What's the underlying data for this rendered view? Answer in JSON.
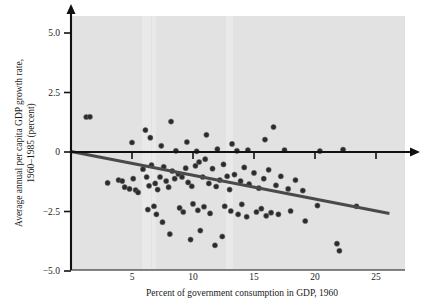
{
  "chart_data": {
    "type": "scatter",
    "title": "",
    "xlabel": "Percent of government consumption in GDP, 1960",
    "ylabel_line1": "Average annual per capita GDP growth rate,",
    "ylabel_line2": "1960–1985 (percent)",
    "xlim": [
      0,
      27.2
    ],
    "ylim": [
      -5.0,
      5.9
    ],
    "xticks": [
      5,
      10,
      15,
      20,
      25
    ],
    "xtick_labels": [
      "5",
      "10",
      "15",
      "20",
      "25"
    ],
    "yticks": [
      5.0,
      2.5,
      0,
      -2.5,
      -5.0
    ],
    "ytick_labels": [
      "5.0",
      "2.5",
      "0",
      "−2.5",
      "−5.0"
    ],
    "grid": false,
    "legend": null,
    "background_color": "#e2e2e2",
    "point_color": "#2b2b2b",
    "fit_line_color": "#4a4a4a",
    "axis_color": "#111111",
    "zero_line_value": 0,
    "fit_line": {
      "x_start": 0.0,
      "y_start": 0.02,
      "x_end": 26.1,
      "y_end": -2.58,
      "slope": -0.0996,
      "intercept": 0.02
    },
    "points": [
      [
        1.25,
        1.47
      ],
      [
        1.55,
        1.48
      ],
      [
        5.0,
        0.4
      ],
      [
        6.1,
        0.92
      ],
      [
        6.5,
        0.6
      ],
      [
        7.4,
        0.26
      ],
      [
        8.2,
        1.28
      ],
      [
        8.6,
        0.05
      ],
      [
        9.5,
        0.42
      ],
      [
        10.3,
        0.03
      ],
      [
        11.1,
        0.72
      ],
      [
        12.0,
        0.12
      ],
      [
        13.2,
        0.34
      ],
      [
        13.6,
        0.05
      ],
      [
        14.5,
        0.08
      ],
      [
        15.9,
        0.52
      ],
      [
        16.6,
        1.05
      ],
      [
        17.5,
        0.08
      ],
      [
        20.4,
        0.04
      ],
      [
        22.3,
        0.1
      ],
      [
        3.0,
        -1.3
      ],
      [
        3.9,
        -1.18
      ],
      [
        4.2,
        -1.22
      ],
      [
        4.4,
        -1.48
      ],
      [
        4.8,
        -1.55
      ],
      [
        5.1,
        -1.12
      ],
      [
        5.3,
        -1.6
      ],
      [
        5.5,
        -1.7
      ],
      [
        5.9,
        -0.72
      ],
      [
        6.2,
        -1.05
      ],
      [
        6.4,
        -1.42
      ],
      [
        6.6,
        -0.55
      ],
      [
        6.9,
        -1.32
      ],
      [
        7.1,
        -1.58
      ],
      [
        7.3,
        -1.05
      ],
      [
        7.6,
        -0.62
      ],
      [
        7.8,
        -1.22
      ],
      [
        8.0,
        -1.48
      ],
      [
        8.3,
        -0.8
      ],
      [
        8.5,
        -1.12
      ],
      [
        8.8,
        -0.92
      ],
      [
        9.1,
        -1.05
      ],
      [
        9.4,
        -0.68
      ],
      [
        9.6,
        -1.28
      ],
      [
        9.9,
        -1.44
      ],
      [
        10.2,
        -0.58
      ],
      [
        10.5,
        -0.42
      ],
      [
        10.8,
        -1.05
      ],
      [
        11.0,
        -0.3
      ],
      [
        11.3,
        -1.32
      ],
      [
        11.6,
        -0.7
      ],
      [
        11.9,
        -1.45
      ],
      [
        12.2,
        -1.18
      ],
      [
        12.5,
        -0.52
      ],
      [
        12.8,
        -1.02
      ],
      [
        13.0,
        -1.58
      ],
      [
        13.4,
        -0.95
      ],
      [
        13.9,
        -1.22
      ],
      [
        14.2,
        -0.65
      ],
      [
        14.6,
        -1.35
      ],
      [
        15.0,
        -0.88
      ],
      [
        15.4,
        -1.52
      ],
      [
        15.8,
        -1.12
      ],
      [
        16.2,
        -0.75
      ],
      [
        16.8,
        -1.4
      ],
      [
        17.2,
        -1.02
      ],
      [
        17.8,
        -1.55
      ],
      [
        18.4,
        -1.18
      ],
      [
        19.0,
        -1.62
      ],
      [
        6.3,
        -2.42
      ],
      [
        6.8,
        -2.28
      ],
      [
        7.0,
        -2.62
      ],
      [
        7.5,
        -2.95
      ],
      [
        8.9,
        -2.35
      ],
      [
        9.2,
        -2.52
      ],
      [
        10.0,
        -2.18
      ],
      [
        10.4,
        -2.45
      ],
      [
        10.9,
        -2.3
      ],
      [
        11.4,
        -2.58
      ],
      [
        12.6,
        -2.28
      ],
      [
        13.1,
        -2.48
      ],
      [
        13.7,
        -2.62
      ],
      [
        14.0,
        -2.2
      ],
      [
        14.4,
        -2.72
      ],
      [
        15.2,
        -2.52
      ],
      [
        15.6,
        -2.38
      ],
      [
        16.0,
        -2.68
      ],
      [
        16.4,
        -2.55
      ],
      [
        17.0,
        -2.62
      ],
      [
        18.0,
        -2.48
      ],
      [
        19.2,
        -2.9
      ],
      [
        20.2,
        -2.25
      ],
      [
        23.4,
        -2.28
      ],
      [
        8.1,
        -3.45
      ],
      [
        9.8,
        -3.68
      ],
      [
        10.6,
        -3.3
      ],
      [
        11.8,
        -3.92
      ],
      [
        12.4,
        -3.55
      ],
      [
        21.8,
        -3.85
      ],
      [
        22.0,
        -4.15
      ]
    ]
  }
}
